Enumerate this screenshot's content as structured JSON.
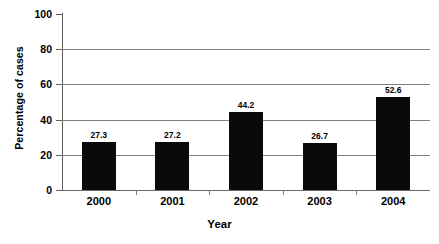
{
  "chart_data": {
    "type": "bar",
    "title": "",
    "xlabel": "Year",
    "ylabel": "Percentage of cases",
    "categories": [
      "2000",
      "2001",
      "2002",
      "2003",
      "2004"
    ],
    "values": [
      27.3,
      27.2,
      44.2,
      26.7,
      52.6
    ],
    "data_labels": [
      "27.3",
      "27.2",
      "44.2",
      "26.7",
      "52.6"
    ],
    "ylim": [
      0,
      100
    ],
    "yticks": [
      0,
      20,
      40,
      60,
      80,
      100
    ],
    "ytick_labels": [
      "0",
      "20",
      "40",
      "60",
      "80",
      "100"
    ],
    "gridlines": true,
    "gridline_color": "#808080",
    "bar_color": "#0a0a0a",
    "legend": null,
    "legend_position": "none",
    "series": [
      {
        "name": "Percentage of cases",
        "values": [
          27.3,
          27.2,
          44.2,
          26.7,
          52.6
        ]
      }
    ]
  }
}
